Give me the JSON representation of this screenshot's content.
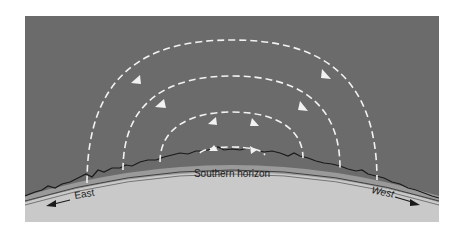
{
  "diagram": {
    "type": "sun-path-arcs",
    "labels": {
      "horizon": "Southern horizon",
      "east": "East",
      "west": "West"
    },
    "colors": {
      "sky": "#6b6b6b",
      "ground": "#c9c9c9",
      "arc": "#f2f2f2",
      "horizon_line": "#1a1a1a",
      "background": "#ffffff"
    },
    "arcs": [
      {
        "name": "outer-path",
        "start_x": 87,
        "end_x": 377,
        "top_y": 40
      },
      {
        "name": "second-path",
        "start_x": 123,
        "end_x": 340,
        "top_y": 76
      },
      {
        "name": "third-path",
        "start_x": 160,
        "end_x": 303,
        "top_y": 112
      },
      {
        "name": "inner-path",
        "start_x": 200,
        "end_x": 265,
        "top_y": 147
      }
    ]
  }
}
